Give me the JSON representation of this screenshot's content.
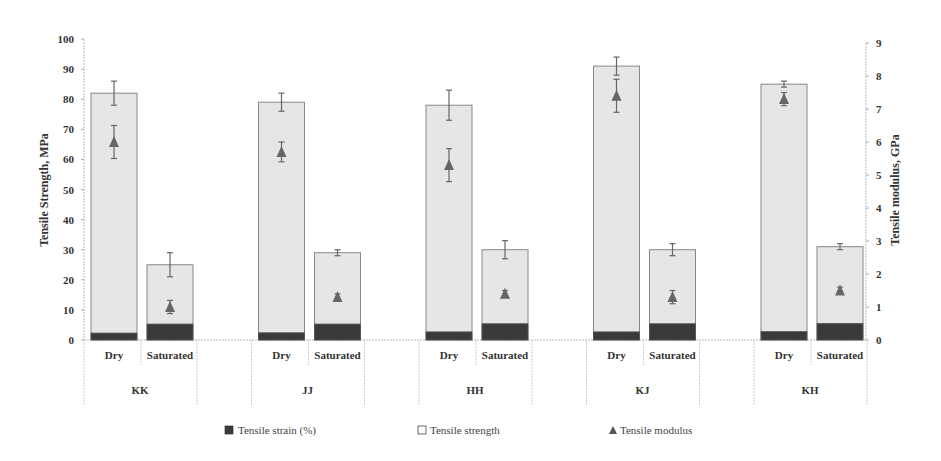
{
  "chart_data": {
    "type": "bar",
    "title": "",
    "groups": [
      "KK",
      "JJ",
      "HH",
      "KJ",
      "KH"
    ],
    "conditions": [
      "Dry",
      "Saturated"
    ],
    "categories": [
      "KK Dry",
      "KK Saturated",
      "JJ Dry",
      "JJ Saturated",
      "HH Dry",
      "HH Saturated",
      "KJ Dry",
      "KJ Saturated",
      "KH Dry",
      "KH Saturated"
    ],
    "ylabel": "Tensile Strength, MPa",
    "ylim": [
      0,
      100
    ],
    "yticks": [
      0,
      10,
      20,
      30,
      40,
      50,
      60,
      70,
      80,
      90,
      100
    ],
    "y2label": "Tensile modulus, GPa",
    "y2lim": [
      0,
      9
    ],
    "y2ticks": [
      0,
      1,
      2,
      3,
      4,
      5,
      6,
      7,
      8,
      9
    ],
    "grid": false,
    "legend_position": "bottom",
    "series": [
      {
        "name": "Tensile strain (%)",
        "axis": "left",
        "kind": "bar",
        "color": "#3a3a3a",
        "values": [
          2.3,
          5.3,
          2.4,
          5.3,
          2.7,
          5.4,
          2.7,
          5.4,
          2.8,
          5.5
        ]
      },
      {
        "name": "Tensile strength",
        "axis": "left",
        "kind": "bar",
        "color": "#e6e6e6",
        "values": [
          82,
          25,
          79,
          29,
          78,
          30,
          91,
          30,
          85,
          31
        ],
        "errors": [
          4,
          4,
          3,
          1,
          5,
          3,
          3,
          2,
          1,
          1
        ]
      },
      {
        "name": "Tensile modulus",
        "axis": "right",
        "kind": "marker",
        "marker": "triangle",
        "color": "#666666",
        "values": [
          6.0,
          1.0,
          5.7,
          1.3,
          5.3,
          1.4,
          7.4,
          1.3,
          7.3,
          1.5
        ],
        "errors": [
          0.5,
          0.2,
          0.3,
          0.1,
          0.5,
          0.1,
          0.5,
          0.2,
          0.2,
          0.1
        ]
      }
    ]
  },
  "legend": {
    "items": [
      {
        "label": "Tensile strain (%)",
        "symbol": "filled-square"
      },
      {
        "label": "Tensile strength",
        "symbol": "open-square"
      },
      {
        "label": "Tensile modulus",
        "symbol": "triangle"
      }
    ]
  }
}
